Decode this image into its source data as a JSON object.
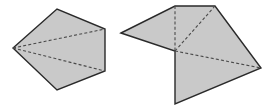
{
  "colors": {
    "fill": "#c9c9c9",
    "stroke": "#2a2a2a",
    "dash": "#4a4a4a",
    "background": "#ffffff"
  },
  "figures": [
    {
      "name": "pentagon",
      "points": "13,48 57,9 105,29 105,71 57,90",
      "folds": [
        {
          "x1": 13,
          "y1": 48,
          "x2": 105,
          "y2": 29
        },
        {
          "x1": 13,
          "y1": 48,
          "x2": 105,
          "y2": 71
        }
      ]
    },
    {
      "name": "unfolded-shape",
      "points": "121,33 175,6 215,6 261,68 175,104 175,51",
      "folds": [
        {
          "x1": 175,
          "y1": 6,
          "x2": 175,
          "y2": 51
        },
        {
          "x1": 215,
          "y1": 6,
          "x2": 175,
          "y2": 51
        },
        {
          "x1": 175,
          "y1": 51,
          "x2": 261,
          "y2": 68
        }
      ]
    }
  ]
}
